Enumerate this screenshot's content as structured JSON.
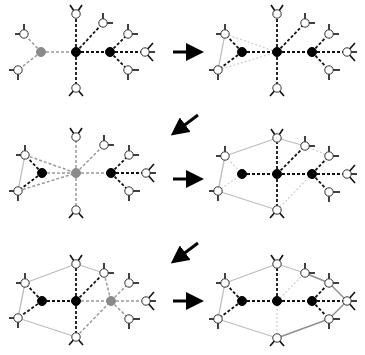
{
  "colors": {
    "background": "#ffffff",
    "black_node": "#000000",
    "gray_node": "#8a8a8a",
    "white_node_fill": "#ffffff",
    "node_stroke": "#333333",
    "dash_dark": "#111111",
    "dash_gray": "#9a9a9a",
    "solid_gray": "#bdbdbd",
    "solid_dark_gray": "#8f8f8f",
    "dotted_light": "#d0d0d0",
    "stub": "#111111",
    "arrow": "#000000"
  },
  "arrows": [
    {
      "name": "arrow-step-1-to-2",
      "x1": 173,
      "y1": 52,
      "x2": 195,
      "y2": 52
    },
    {
      "name": "arrow-step-2-to-3",
      "x1": 198,
      "y1": 115,
      "x2": 178,
      "y2": 130
    },
    {
      "name": "arrow-step-3-to-4",
      "x1": 173,
      "y1": 179,
      "x2": 195,
      "y2": 179
    },
    {
      "name": "arrow-step-4-to-5",
      "x1": 198,
      "y1": 243,
      "x2": 178,
      "y2": 258
    },
    {
      "name": "arrow-step-5-to-6",
      "x1": 173,
      "y1": 301,
      "x2": 195,
      "y2": 301
    }
  ],
  "panels": [
    {
      "name": "panel-1",
      "dx": 0,
      "dy": 0,
      "nodes": {
        "L1": {
          "x": 24,
          "y": 34,
          "t": "w"
        },
        "L2": {
          "x": 18,
          "y": 70,
          "t": "w"
        },
        "A": {
          "x": 41,
          "y": 52,
          "t": "g"
        },
        "C": {
          "x": 76,
          "y": 52,
          "t": "b"
        },
        "T": {
          "x": 76,
          "y": 14,
          "t": "w"
        },
        "B": {
          "x": 76,
          "y": 88,
          "t": "w"
        },
        "U": {
          "x": 103,
          "y": 23,
          "t": "w"
        },
        "R": {
          "x": 110,
          "y": 52,
          "t": "b"
        },
        "R1": {
          "x": 128,
          "y": 34,
          "t": "w"
        },
        "R2": {
          "x": 128,
          "y": 70,
          "t": "w"
        },
        "F": {
          "x": 145,
          "y": 52,
          "t": "w"
        }
      },
      "edges": [
        [
          "A",
          "L1",
          "dg"
        ],
        [
          "A",
          "L2",
          "dg"
        ],
        [
          "A",
          "C",
          "dg"
        ],
        [
          "C",
          "T",
          "dd"
        ],
        [
          "C",
          "B",
          "dd"
        ],
        [
          "C",
          "U",
          "dd"
        ],
        [
          "C",
          "R",
          "dd"
        ],
        [
          "R",
          "R1",
          "dd"
        ],
        [
          "R",
          "R2",
          "dd"
        ],
        [
          "R",
          "F",
          "dd"
        ]
      ]
    },
    {
      "name": "panel-2",
      "dx": 201,
      "dy": 0,
      "nodes": {
        "L1": {
          "x": 24,
          "y": 34,
          "t": "w"
        },
        "L2": {
          "x": 17,
          "y": 70,
          "t": "w"
        },
        "A": {
          "x": 41,
          "y": 52,
          "t": "b"
        },
        "C": {
          "x": 76,
          "y": 52,
          "t": "b"
        },
        "T": {
          "x": 76,
          "y": 14,
          "t": "w"
        },
        "B": {
          "x": 76,
          "y": 88,
          "t": "w"
        },
        "U": {
          "x": 104,
          "y": 23,
          "t": "w"
        },
        "R": {
          "x": 111,
          "y": 52,
          "t": "b"
        },
        "R1": {
          "x": 128,
          "y": 34,
          "t": "w"
        },
        "R2": {
          "x": 128,
          "y": 70,
          "t": "w"
        },
        "F": {
          "x": 146,
          "y": 52,
          "t": "w"
        }
      },
      "edges": [
        [
          "L1",
          "L2",
          "sg"
        ],
        [
          "L1",
          "C",
          "dl"
        ],
        [
          "L2",
          "C",
          "dl"
        ],
        [
          "A",
          "L1",
          "dd"
        ],
        [
          "A",
          "L2",
          "dd"
        ],
        [
          "A",
          "C",
          "dd"
        ],
        [
          "C",
          "T",
          "dd"
        ],
        [
          "C",
          "B",
          "dd"
        ],
        [
          "C",
          "U",
          "dd"
        ],
        [
          "C",
          "R",
          "dd"
        ],
        [
          "R",
          "R1",
          "dd"
        ],
        [
          "R",
          "R2",
          "dd"
        ],
        [
          "R",
          "F",
          "dd"
        ]
      ]
    },
    {
      "name": "panel-3",
      "dx": 0,
      "dy": 121,
      "nodes": {
        "L1": {
          "x": 25,
          "y": 34,
          "t": "w"
        },
        "L2": {
          "x": 18,
          "y": 70,
          "t": "w"
        },
        "A": {
          "x": 42,
          "y": 52,
          "t": "b"
        },
        "C": {
          "x": 76,
          "y": 52,
          "t": "g"
        },
        "T": {
          "x": 76,
          "y": 16,
          "t": "w"
        },
        "B": {
          "x": 76,
          "y": 89,
          "t": "w"
        },
        "U": {
          "x": 104,
          "y": 24,
          "t": "w"
        },
        "R": {
          "x": 111,
          "y": 52,
          "t": "b"
        },
        "R1": {
          "x": 129,
          "y": 34,
          "t": "w"
        },
        "R2": {
          "x": 129,
          "y": 70,
          "t": "w"
        },
        "F": {
          "x": 146,
          "y": 52,
          "t": "w"
        }
      },
      "edges": [
        [
          "L1",
          "L2",
          "sg"
        ],
        [
          "L1",
          "C",
          "dg"
        ],
        [
          "L2",
          "C",
          "dg"
        ],
        [
          "A",
          "L1",
          "dd"
        ],
        [
          "A",
          "L2",
          "dd"
        ],
        [
          "A",
          "C",
          "dg"
        ],
        [
          "C",
          "T",
          "dg"
        ],
        [
          "C",
          "B",
          "dg"
        ],
        [
          "C",
          "U",
          "dg"
        ],
        [
          "C",
          "R",
          "dg"
        ],
        [
          "R",
          "R1",
          "dd"
        ],
        [
          "R",
          "R2",
          "dd"
        ],
        [
          "R",
          "F",
          "dd"
        ]
      ]
    },
    {
      "name": "panel-4",
      "dx": 201,
      "dy": 121,
      "nodes": {
        "L1": {
          "x": 24,
          "y": 35,
          "t": "w"
        },
        "L2": {
          "x": 17,
          "y": 70,
          "t": "w"
        },
        "A": {
          "x": 41,
          "y": 53,
          "t": "b"
        },
        "C": {
          "x": 76,
          "y": 53,
          "t": "b"
        },
        "T": {
          "x": 76,
          "y": 17,
          "t": "w"
        },
        "B": {
          "x": 76,
          "y": 89,
          "t": "w"
        },
        "U": {
          "x": 104,
          "y": 25,
          "t": "w"
        },
        "R": {
          "x": 111,
          "y": 53,
          "t": "b"
        },
        "R1": {
          "x": 128,
          "y": 35,
          "t": "w"
        },
        "R2": {
          "x": 128,
          "y": 71,
          "t": "w"
        },
        "F": {
          "x": 146,
          "y": 53,
          "t": "w"
        }
      },
      "edges": [
        [
          "L1",
          "L2",
          "sg"
        ],
        [
          "L1",
          "T",
          "sg"
        ],
        [
          "T",
          "U",
          "sg"
        ],
        [
          "L2",
          "B",
          "sg"
        ],
        [
          "L1",
          "A",
          "dl"
        ],
        [
          "L2",
          "A",
          "dl"
        ],
        [
          "U",
          "R1",
          "dl"
        ],
        [
          "B",
          "R",
          "dl"
        ],
        [
          "A",
          "C",
          "dd"
        ],
        [
          "C",
          "T",
          "dd"
        ],
        [
          "C",
          "B",
          "dd"
        ],
        [
          "C",
          "U",
          "dd"
        ],
        [
          "C",
          "R",
          "dd"
        ],
        [
          "R",
          "R1",
          "dd"
        ],
        [
          "R",
          "R2",
          "dd"
        ],
        [
          "R",
          "F",
          "dd"
        ]
      ]
    },
    {
      "name": "panel-5",
      "dx": 0,
      "dy": 249,
      "nodes": {
        "L1": {
          "x": 25,
          "y": 34,
          "t": "w"
        },
        "L2": {
          "x": 18,
          "y": 69,
          "t": "w"
        },
        "A": {
          "x": 42,
          "y": 52,
          "t": "b"
        },
        "C": {
          "x": 76,
          "y": 52,
          "t": "b"
        },
        "T": {
          "x": 76,
          "y": 15,
          "t": "w"
        },
        "B": {
          "x": 76,
          "y": 88,
          "t": "w"
        },
        "U": {
          "x": 104,
          "y": 24,
          "t": "w"
        },
        "R": {
          "x": 111,
          "y": 52,
          "t": "g"
        },
        "R1": {
          "x": 129,
          "y": 34,
          "t": "w"
        },
        "R2": {
          "x": 129,
          "y": 70,
          "t": "w"
        },
        "F": {
          "x": 146,
          "y": 52,
          "t": "w"
        }
      },
      "edges": [
        [
          "L1",
          "L2",
          "sg"
        ],
        [
          "L1",
          "T",
          "sg"
        ],
        [
          "T",
          "U",
          "sg"
        ],
        [
          "L2",
          "B",
          "sg"
        ],
        [
          "A",
          "L1",
          "dd"
        ],
        [
          "A",
          "L2",
          "dd"
        ],
        [
          "A",
          "C",
          "dd"
        ],
        [
          "C",
          "T",
          "dd"
        ],
        [
          "C",
          "B",
          "dd"
        ],
        [
          "C",
          "U",
          "dd"
        ],
        [
          "C",
          "R",
          "dg"
        ],
        [
          "U",
          "R",
          "dg"
        ],
        [
          "B",
          "R",
          "dg"
        ],
        [
          "R",
          "R1",
          "dg"
        ],
        [
          "R",
          "R2",
          "dg"
        ],
        [
          "R",
          "F",
          "dg"
        ]
      ]
    },
    {
      "name": "panel-6",
      "dx": 201,
      "dy": 249,
      "nodes": {
        "L1": {
          "x": 24,
          "y": 34,
          "t": "w"
        },
        "L2": {
          "x": 17,
          "y": 70,
          "t": "w"
        },
        "A": {
          "x": 41,
          "y": 52,
          "t": "b"
        },
        "C": {
          "x": 76,
          "y": 52,
          "t": "b"
        },
        "T": {
          "x": 76,
          "y": 15,
          "t": "w"
        },
        "B": {
          "x": 76,
          "y": 89,
          "t": "w"
        },
        "U": {
          "x": 104,
          "y": 24,
          "t": "w"
        },
        "R": {
          "x": 111,
          "y": 52,
          "t": "b"
        },
        "R1": {
          "x": 128,
          "y": 34,
          "t": "w"
        },
        "R2": {
          "x": 128,
          "y": 70,
          "t": "w"
        },
        "F": {
          "x": 146,
          "y": 52,
          "t": "w"
        }
      },
      "edges": [
        [
          "L1",
          "L2",
          "sg"
        ],
        [
          "L1",
          "T",
          "sg"
        ],
        [
          "T",
          "U",
          "sg"
        ],
        [
          "L2",
          "B",
          "sg"
        ],
        [
          "U",
          "R1",
          "sd"
        ],
        [
          "R1",
          "F",
          "sd"
        ],
        [
          "F",
          "R2",
          "sd"
        ],
        [
          "R2",
          "B",
          "sd"
        ],
        [
          "C",
          "U",
          "dl"
        ],
        [
          "C",
          "B",
          "dl"
        ],
        [
          "A",
          "L1",
          "dd"
        ],
        [
          "A",
          "L2",
          "dd"
        ],
        [
          "A",
          "C",
          "dd"
        ],
        [
          "C",
          "T",
          "dd"
        ],
        [
          "C",
          "R",
          "dd"
        ],
        [
          "R",
          "R1",
          "dd"
        ],
        [
          "R",
          "R2",
          "dd"
        ],
        [
          "R",
          "F",
          "dd"
        ]
      ]
    }
  ],
  "stubs": {
    "L1": [
      [
        -9,
        0
      ],
      [
        0,
        -10
      ],
      [
        0,
        0
      ]
    ],
    "L2": [
      [
        -9,
        0
      ],
      [
        0,
        10
      ],
      [
        0,
        0
      ]
    ],
    "T": [
      [
        -6,
        -9
      ],
      [
        6,
        -9
      ]
    ],
    "B": [
      [
        -7,
        8
      ],
      [
        7,
        8
      ]
    ],
    "U": [
      [
        0,
        -10
      ],
      [
        10,
        0
      ]
    ],
    "R1": [
      [
        0,
        -10
      ],
      [
        10,
        0
      ]
    ],
    "R2": [
      [
        0,
        10
      ],
      [
        11,
        0
      ]
    ],
    "F": [
      [
        8,
        -9
      ],
      [
        8,
        9
      ],
      [
        10,
        0
      ]
    ]
  },
  "legend": {
    "node_types": {
      "b": "black-node",
      "g": "gray-node",
      "w": "white-node"
    },
    "edge_types": {
      "dd": "dashed-dark",
      "dg": "dashed-gray",
      "dl": "dotted-light",
      "sg": "solid-gray",
      "sd": "solid-dark-gray"
    }
  }
}
